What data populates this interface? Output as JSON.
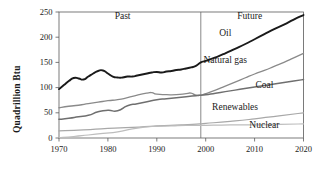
{
  "chart_data": {
    "type": "line",
    "title": "",
    "xlabel": "",
    "ylabel": "Quadrillion Btu",
    "xlim": [
      1970,
      2020
    ],
    "ylim": [
      0,
      250
    ],
    "xticks": [
      1970,
      1980,
      1990,
      2000,
      2010,
      2020
    ],
    "xtick_labels": [
      "1970",
      "1980",
      "1990",
      "2000",
      "2010",
      "2020"
    ],
    "yticks": [
      0,
      50,
      100,
      150,
      200,
      250
    ],
    "ytick_labels": [
      "0",
      "50",
      "100",
      "150",
      "200",
      "250"
    ],
    "grid": false,
    "legend": "inline-labels",
    "annotations": [
      {
        "text": "Past",
        "x": 1983,
        "y": 240,
        "name": "past-label"
      },
      {
        "text": "Future",
        "x": 2009,
        "y": 240,
        "name": "future-label"
      },
      {
        "text": "Oil",
        "x": 2004,
        "y": 207,
        "name": "oil-label"
      },
      {
        "text": "Natural gas",
        "x": 2004,
        "y": 152,
        "name": "natural-gas-label"
      },
      {
        "text": "Coal",
        "x": 2012,
        "y": 104,
        "name": "coal-label"
      },
      {
        "text": "Renewables",
        "x": 2006,
        "y": 59,
        "name": "renewables-label"
      },
      {
        "text": "Nuclear",
        "x": 2012,
        "y": 23,
        "name": "nuclear-label"
      }
    ],
    "divider": {
      "x": 1999,
      "label": "past-future-divider"
    },
    "series": [
      {
        "name": "Oil",
        "color": "#1a1a1a",
        "width": 1.9,
        "x": [
          1970,
          1971,
          1972,
          1973,
          1974,
          1975,
          1976,
          1977,
          1978,
          1979,
          1980,
          1981,
          1982,
          1983,
          1984,
          1985,
          1986,
          1987,
          1988,
          1989,
          1990,
          1991,
          1992,
          1993,
          1994,
          1995,
          1996,
          1997,
          1998,
          1999,
          2000,
          2002,
          2004,
          2006,
          2008,
          2010,
          2012,
          2014,
          2016,
          2018,
          2020
        ],
        "y": [
          97,
          105,
          113,
          119,
          118,
          116,
          122,
          128,
          133,
          134,
          128,
          122,
          120,
          120,
          122,
          122,
          124,
          126,
          128,
          130,
          131,
          130,
          132,
          133,
          135,
          136,
          138,
          140,
          143,
          150,
          153,
          160,
          168,
          177,
          186,
          196,
          206,
          216,
          225,
          235,
          244
        ]
      },
      {
        "name": "Natural gas",
        "color": "#8a8a8a",
        "width": 1.3,
        "x": [
          1970,
          1972,
          1974,
          1976,
          1978,
          1980,
          1982,
          1984,
          1986,
          1988,
          1989,
          1990,
          1992,
          1994,
          1996,
          1997,
          1998,
          1999,
          2000,
          2002,
          2004,
          2006,
          2008,
          2010,
          2012,
          2014,
          2016,
          2018,
          2020
        ],
        "y": [
          60,
          63,
          65,
          68,
          71,
          74,
          76,
          80,
          85,
          89,
          90,
          87,
          86,
          86,
          88,
          89,
          85,
          85,
          88,
          95,
          103,
          111,
          119,
          127,
          134,
          142,
          150,
          159,
          168
        ]
      },
      {
        "name": "Coal",
        "color": "#6f6f6f",
        "width": 1.5,
        "x": [
          1970,
          1972,
          1974,
          1976,
          1978,
          1980,
          1982,
          1984,
          1986,
          1988,
          1990,
          1992,
          1994,
          1996,
          1998,
          1999,
          2000,
          2002,
          2004,
          2006,
          2008,
          2010,
          2012,
          2014,
          2016,
          2018,
          2020
        ],
        "y": [
          37,
          39,
          42,
          45,
          52,
          55,
          54,
          64,
          68,
          72,
          76,
          78,
          80,
          82,
          84,
          85,
          86,
          89,
          92,
          95,
          98,
          101,
          104,
          107,
          110,
          113,
          116
        ]
      },
      {
        "name": "Renewables",
        "color": "#a8a8a8",
        "width": 1.2,
        "x": [
          1970,
          1975,
          1980,
          1985,
          1990,
          1995,
          1999,
          2000,
          2005,
          2010,
          2015,
          2020
        ],
        "y": [
          14,
          16,
          19,
          21,
          24,
          26,
          28,
          29,
          33,
          38,
          44,
          50
        ]
      },
      {
        "name": "Nuclear",
        "color": "#bdbdbd",
        "width": 1.2,
        "x": [
          1970,
          1973,
          1976,
          1979,
          1982,
          1985,
          1988,
          1990,
          1993,
          1996,
          1999,
          2000,
          2005,
          2010,
          2015,
          2020
        ],
        "y": [
          1,
          3,
          6,
          9,
          12,
          18,
          22,
          23,
          24,
          25,
          25,
          25,
          26,
          26,
          27,
          28
        ]
      }
    ]
  }
}
